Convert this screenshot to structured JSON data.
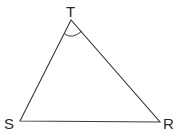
{
  "diagram": {
    "type": "triangle",
    "vertices": {
      "T": {
        "label": "T",
        "x": 71,
        "y": 20
      },
      "S": {
        "label": "S",
        "x": 20,
        "y": 121
      },
      "R": {
        "label": "R",
        "x": 160,
        "y": 122
      }
    },
    "angle_marked": "T",
    "colors": {
      "stroke": "#3a3a3a",
      "background": "#ffffff"
    }
  }
}
